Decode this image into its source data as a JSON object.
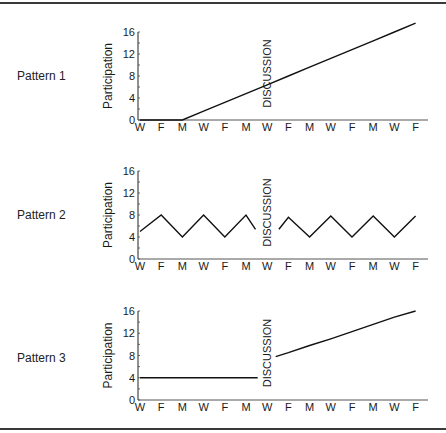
{
  "chart_data": [
    {
      "type": "line",
      "title": "Pattern 1",
      "xlabel": "",
      "ylabel": "Participation",
      "ylim": [
        0,
        16
      ],
      "yticks": [
        0,
        4,
        8,
        12,
        16
      ],
      "categories": [
        "W",
        "F",
        "M",
        "W",
        "F",
        "M",
        "W",
        "F",
        "M",
        "W",
        "F",
        "M",
        "W",
        "F"
      ],
      "annotation": {
        "text": "DISCUSSION",
        "x_index": 6
      },
      "segments": [
        {
          "x": [
            0,
            1,
            2,
            3,
            4,
            5,
            6,
            7,
            8,
            9,
            10,
            11,
            12,
            13
          ],
          "values": [
            0,
            0,
            0,
            1.6,
            3.2,
            4.8,
            6.4,
            8,
            9.6,
            11.2,
            12.8,
            14.4,
            16,
            17.6
          ]
        }
      ],
      "grid": false
    },
    {
      "type": "line",
      "title": "Pattern 2",
      "xlabel": "",
      "ylabel": "Participation",
      "ylim": [
        0,
        16
      ],
      "yticks": [
        0,
        4,
        8,
        12,
        16
      ],
      "categories": [
        "W",
        "F",
        "M",
        "W",
        "F",
        "M",
        "W",
        "F",
        "M",
        "W",
        "F",
        "M",
        "W",
        "F"
      ],
      "annotation": {
        "text": "DISCUSSION",
        "x_index": 6
      },
      "segments": [
        {
          "x": [
            0,
            1,
            2,
            3,
            4,
            5,
            5.45
          ],
          "values": [
            5,
            8,
            4,
            8,
            4,
            8,
            5.4
          ]
        },
        {
          "x": [
            6.55,
            7,
            8,
            9,
            10,
            11,
            12,
            13
          ],
          "values": [
            5.4,
            7.6,
            4,
            7.8,
            4,
            7.8,
            4,
            7.8
          ]
        }
      ],
      "grid": false
    },
    {
      "type": "line",
      "title": "Pattern 3",
      "xlabel": "",
      "ylabel": "Participation",
      "ylim": [
        0,
        16
      ],
      "yticks": [
        0,
        4,
        8,
        12,
        16
      ],
      "categories": [
        "W",
        "F",
        "M",
        "W",
        "F",
        "M",
        "W",
        "F",
        "M",
        "W",
        "F",
        "M",
        "W",
        "F"
      ],
      "annotation": {
        "text": "DISCUSSION",
        "x_index": 6
      },
      "segments": [
        {
          "x": [
            0,
            5.55
          ],
          "values": [
            4,
            4
          ]
        },
        {
          "x": [
            6.4,
            7,
            8,
            9,
            10,
            11,
            12,
            13
          ],
          "values": [
            7.8,
            8.5,
            9.8,
            11,
            12.3,
            13.6,
            14.9,
            16
          ]
        }
      ],
      "grid": false
    }
  ],
  "panels": [
    {
      "label": "Pattern 1",
      "ylabel": "Participation",
      "annotation": "DISCUSSION"
    },
    {
      "label": "Pattern 2",
      "ylabel": "Participation",
      "annotation": "DISCUSSION"
    },
    {
      "label": "Pattern 3",
      "ylabel": "Participation",
      "annotation": "DISCUSSION"
    }
  ]
}
